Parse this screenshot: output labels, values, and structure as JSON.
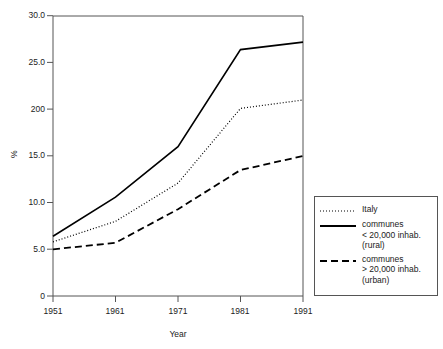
{
  "chart_data": {
    "type": "line",
    "title": "",
    "xlabel": "Year",
    "ylabel": "%",
    "x": [
      1951,
      1961,
      1971,
      1981,
      1991
    ],
    "xticklabels": [
      "1951",
      "1961",
      "1971",
      "1981",
      "1991"
    ],
    "xlim": [
      1951,
      1991
    ],
    "ylim": [
      0,
      30
    ],
    "yticks": [
      0,
      5,
      10,
      15,
      20,
      25,
      30
    ],
    "yticklabels": [
      "0",
      "5.0",
      "10.0",
      "15.0",
      "200",
      "25.0",
      "30.0"
    ],
    "grid": false,
    "legend_position": "right-outside",
    "series": [
      {
        "name": "Italy",
        "style": "dotted",
        "color": "#000000",
        "values": [
          5.8,
          8.0,
          12.1,
          20.1,
          21.0
        ]
      },
      {
        "name": "communes < 20,000 inhab. (rural)",
        "style": "solid",
        "color": "#000000",
        "values": [
          6.4,
          10.6,
          16.0,
          26.4,
          27.2
        ]
      },
      {
        "name": "communes > 20,000 inhab. (urban)",
        "style": "dashed",
        "color": "#000000",
        "values": [
          5.0,
          5.7,
          9.3,
          13.5,
          15.0
        ]
      }
    ]
  },
  "legend": {
    "entries": [
      {
        "key": "dotted",
        "lines": [
          "Italy"
        ]
      },
      {
        "key": "solid",
        "lines": [
          "communes",
          "< 20,000 inhab.",
          "(rural)"
        ]
      },
      {
        "key": "dashed",
        "lines": [
          "communes",
          "> 20,000 inhab.",
          "(urban)"
        ]
      }
    ]
  }
}
